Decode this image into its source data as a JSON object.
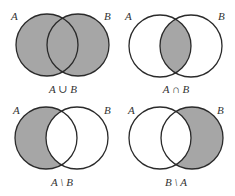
{
  "colors": {
    "fill": "#a6a6a6",
    "stroke": "#2a2a2a",
    "background": "#ffffff",
    "text": "#333333"
  },
  "set_labels": {
    "a": "A",
    "b": "B"
  },
  "panels": [
    {
      "id": "union",
      "caption": "A ∪ B",
      "shaded": "union"
    },
    {
      "id": "intersection",
      "caption": "A ∩ B",
      "shaded": "intersection"
    },
    {
      "id": "a-minus-b",
      "caption": "A \\ B",
      "shaded": "a-only"
    },
    {
      "id": "b-minus-a",
      "caption": "B \\ A",
      "shaded": "b-only"
    }
  ]
}
